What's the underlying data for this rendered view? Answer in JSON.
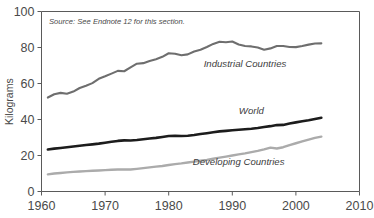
{
  "chart_data": {
    "type": "line",
    "title": "",
    "xlabel": "",
    "ylabel": "Kilograms",
    "xlim": [
      1960,
      2010
    ],
    "ylim": [
      0,
      100
    ],
    "grid": false,
    "legend_position": "inline-annotations",
    "xticks": [
      "1960",
      "1970",
      "1980",
      "1990",
      "2000",
      "2010"
    ],
    "xtick_values": [
      1960,
      1970,
      1980,
      1990,
      2000,
      2010
    ],
    "yticks": [
      "0",
      "20",
      "40",
      "60",
      "80",
      "100"
    ],
    "ytick_values": [
      0,
      20,
      40,
      60,
      80,
      100
    ],
    "annotation": "Source: See Endnote 12 for this section.",
    "x": [
      1961,
      1962,
      1963,
      1964,
      1965,
      1966,
      1967,
      1968,
      1969,
      1970,
      1971,
      1972,
      1973,
      1974,
      1975,
      1976,
      1977,
      1978,
      1979,
      1980,
      1981,
      1982,
      1983,
      1984,
      1985,
      1986,
      1987,
      1988,
      1989,
      1990,
      1991,
      1992,
      1993,
      1994,
      1995,
      1996,
      1997,
      1998,
      1999,
      2000,
      2001,
      2002,
      2003,
      2004
    ],
    "series": [
      {
        "name": "Industrial Countries",
        "color": "#6e6e6e",
        "label_x": 1992,
        "label_y": 69,
        "values": [
          52.2,
          54.0,
          54.8,
          54.3,
          55.5,
          57.5,
          58.8,
          60.2,
          62.6,
          64.0,
          65.5,
          67.0,
          66.8,
          69.0,
          71.0,
          71.3,
          72.5,
          73.5,
          74.8,
          76.8,
          76.5,
          75.7,
          76.2,
          77.8,
          78.8,
          80.3,
          82.0,
          83.2,
          82.9,
          83.3,
          81.7,
          80.8,
          80.6,
          80.0,
          78.8,
          79.5,
          80.8,
          80.8,
          80.3,
          80.2,
          80.8,
          81.6,
          82.2,
          82.3
        ]
      },
      {
        "name": "World",
        "color": "#1c1c1c",
        "label_x": 1993,
        "label_y": 43,
        "values": [
          23.3,
          23.8,
          24.2,
          24.6,
          25.0,
          25.4,
          25.8,
          26.2,
          26.6,
          27.1,
          27.6,
          28.1,
          28.4,
          28.3,
          28.6,
          29.0,
          29.4,
          29.8,
          30.3,
          30.8,
          31.0,
          30.8,
          31.0,
          31.4,
          31.9,
          32.4,
          32.9,
          33.4,
          33.7,
          34.0,
          34.3,
          34.6,
          34.9,
          35.3,
          35.8,
          36.3,
          36.9,
          37.0,
          37.8,
          38.4,
          39.0,
          39.6,
          40.3,
          41.0
        ]
      },
      {
        "name": "Developing Countries",
        "color": "#ababab",
        "label_x": 1991,
        "label_y": 15,
        "values": [
          9.5,
          10.0,
          10.3,
          10.6,
          10.9,
          11.1,
          11.3,
          11.5,
          11.7,
          11.9,
          12.1,
          12.2,
          12.3,
          12.2,
          12.6,
          13.0,
          13.4,
          13.8,
          14.2,
          14.7,
          15.2,
          15.6,
          16.1,
          16.6,
          17.1,
          17.6,
          18.2,
          18.8,
          19.4,
          20.0,
          20.6,
          21.2,
          21.9,
          22.6,
          23.4,
          24.4,
          23.9,
          24.6,
          25.8,
          26.8,
          27.8,
          28.8,
          29.8,
          30.5
        ]
      }
    ]
  }
}
